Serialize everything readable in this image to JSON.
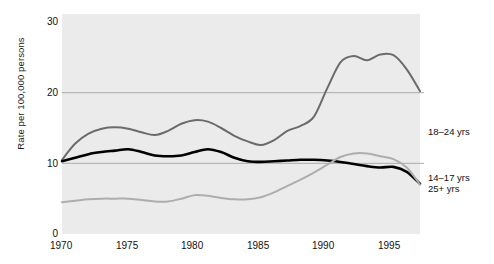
{
  "chart_data": {
    "type": "line",
    "title": "",
    "xlabel": "",
    "ylabel": "Rate per 100,000 persons",
    "xlim": [
      1970,
      1997
    ],
    "ylim": [
      0,
      30
    ],
    "xticks": [
      "1970",
      "1975",
      "1980",
      "1985",
      "1990",
      "1995"
    ],
    "xtick_values": [
      1970,
      1975,
      1980,
      1985,
      1990,
      1995
    ],
    "yticks": [
      "0",
      "10",
      "20",
      "30"
    ],
    "ytick_values": [
      0,
      10,
      20,
      30
    ],
    "grid": "horizontal-gridlines-at-10-and-20",
    "legend_position": "right-of-plot-inline",
    "plot_background": "#ebebeb",
    "x": [
      1970,
      1971,
      1972,
      1973,
      1974,
      1975,
      1976,
      1977,
      1978,
      1979,
      1980,
      1981,
      1982,
      1983,
      1984,
      1985,
      1986,
      1987,
      1988,
      1989,
      1990,
      1991,
      1992,
      1993,
      1994,
      1995,
      1996,
      1997
    ],
    "series": [
      {
        "name": "18–24 yrs",
        "label": "18–24 yrs",
        "color": "#6b6b6b",
        "values": [
          10.5,
          12.8,
          14.2,
          14.9,
          15.1,
          14.9,
          14.4,
          14.0,
          14.6,
          15.6,
          16.1,
          15.9,
          15.0,
          13.9,
          13.1,
          12.6,
          13.3,
          14.6,
          15.3,
          16.6,
          20.6,
          24.3,
          25.2,
          24.6,
          25.4,
          25.3,
          23.3,
          20.2
        ]
      },
      {
        "name": "14–17 yrs",
        "label": "14–17 yrs",
        "color": "#000000",
        "values": [
          10.3,
          10.8,
          11.3,
          11.6,
          11.8,
          12.0,
          11.6,
          11.1,
          11.0,
          11.1,
          11.6,
          12.0,
          11.6,
          10.8,
          10.3,
          10.2,
          10.3,
          10.4,
          10.5,
          10.5,
          10.4,
          10.2,
          9.9,
          9.6,
          9.4,
          9.5,
          8.8,
          7.1
        ]
      },
      {
        "name": "25+ yrs",
        "label": "25+ yrs",
        "color": "#adadad",
        "values": [
          4.5,
          4.7,
          4.9,
          5.0,
          5.0,
          5.0,
          4.8,
          4.6,
          4.6,
          5.0,
          5.5,
          5.4,
          5.1,
          4.9,
          4.9,
          5.2,
          5.9,
          6.8,
          7.7,
          8.7,
          9.8,
          10.9,
          11.4,
          11.4,
          11.0,
          10.6,
          9.4,
          7.0
        ]
      }
    ]
  },
  "labels": {
    "y_axis": "Rate per 100,000 persons",
    "series_18_24": "18–24 yrs",
    "series_14_17": "14–17 yrs",
    "series_25_plus": "25+ yrs",
    "y0": "0",
    "y10": "10",
    "y20": "20",
    "y30": "30",
    "x1970": "1970",
    "x1975": "1975",
    "x1980": "1980",
    "x1985": "1985",
    "x1990": "1990",
    "x1995": "1995"
  }
}
